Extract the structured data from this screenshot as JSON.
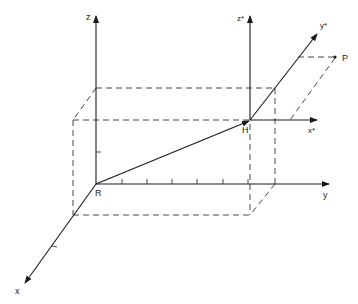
{
  "labels": {
    "z": "z",
    "y": "y",
    "x": "x",
    "R": "R",
    "H": "H",
    "z_star": "z*",
    "y_star": "y*",
    "x_star": "x*",
    "P": "P"
  },
  "colors": {
    "line": "#1a1a1a",
    "background": "#ffffff"
  }
}
